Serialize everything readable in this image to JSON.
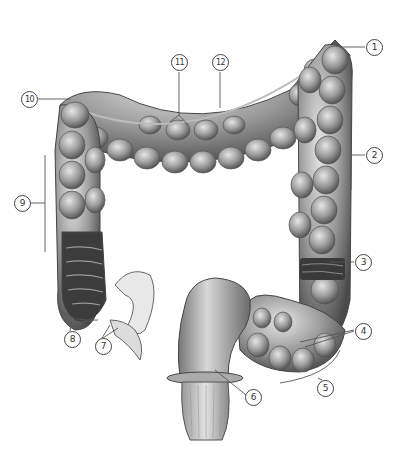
{
  "figure": {
    "colors": {
      "tissue_dark": "#5a5a5a",
      "tissue_mid": "#8f8f8f",
      "tissue_light": "#d4d4d4",
      "line": "#555555"
    },
    "labels": [
      {
        "id": "1",
        "text": "1",
        "x": 366,
        "y": 39
      },
      {
        "id": "2",
        "text": "2",
        "x": 366,
        "y": 147
      },
      {
        "id": "3",
        "text": "3",
        "x": 355,
        "y": 254
      },
      {
        "id": "4",
        "text": "4",
        "x": 355,
        "y": 323
      },
      {
        "id": "5",
        "text": "5",
        "x": 317,
        "y": 380
      },
      {
        "id": "6",
        "text": "6",
        "x": 245,
        "y": 389
      },
      {
        "id": "7",
        "text": "7",
        "x": 95,
        "y": 338
      },
      {
        "id": "8",
        "text": "8",
        "x": 64,
        "y": 331
      },
      {
        "id": "9",
        "text": "9",
        "x": 14,
        "y": 195
      },
      {
        "id": "10",
        "text": "10",
        "x": 21,
        "y": 91
      },
      {
        "id": "11",
        "text": "11",
        "x": 171,
        "y": 54
      },
      {
        "id": "12",
        "text": "12",
        "x": 212,
        "y": 54
      }
    ]
  }
}
